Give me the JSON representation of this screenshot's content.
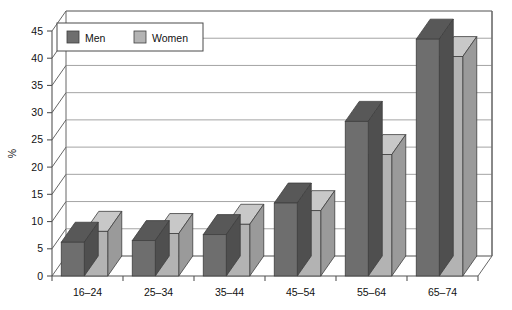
{
  "chart_data": {
    "type": "bar",
    "title": "",
    "subtitle": "",
    "xlabel": "",
    "ylabel": "%",
    "ylim": [
      0,
      45
    ],
    "ytick_step": 5,
    "yticks": [
      "0",
      "5",
      "10",
      "15",
      "20",
      "25",
      "30",
      "35",
      "40",
      "45"
    ],
    "grid": true,
    "three_d": true,
    "legend_position": "top-left",
    "categories": [
      "16–24",
      "25–34",
      "35–44",
      "45–54",
      "55–64",
      "65–74"
    ],
    "series": [
      {
        "name": "Men",
        "color": "#6e6e6e",
        "values": [
          6.2,
          6.5,
          7.6,
          13.4,
          28.4,
          43.5
        ]
      },
      {
        "name": "Women",
        "color": "#b3b3b3",
        "values": [
          8.2,
          7.8,
          9.5,
          12.0,
          22.3,
          40.3
        ]
      }
    ]
  },
  "legend": {
    "items": [
      {
        "label": "Men",
        "swatch": "#6e6e6e"
      },
      {
        "label": "Women",
        "swatch": "#b3b3b3"
      }
    ]
  },
  "axis": {
    "y_title": "%",
    "y_tick_labels": [
      "45",
      "40",
      "35",
      "30",
      "25",
      "20",
      "15",
      "10",
      "5",
      "0"
    ],
    "x_tick_labels": [
      "16–24",
      "25–34",
      "35–44",
      "45–54",
      "55–64",
      "65–74"
    ]
  },
  "colors": {
    "men_front": "#6e6e6e",
    "men_top": "#585858",
    "men_side": "#4f4f4f",
    "women_front": "#b3b3b3",
    "women_top": "#c8c8c8",
    "women_side": "#9a9a9a",
    "grid": "#9a9a9a",
    "axis": "#555555",
    "background": "#ffffff"
  }
}
